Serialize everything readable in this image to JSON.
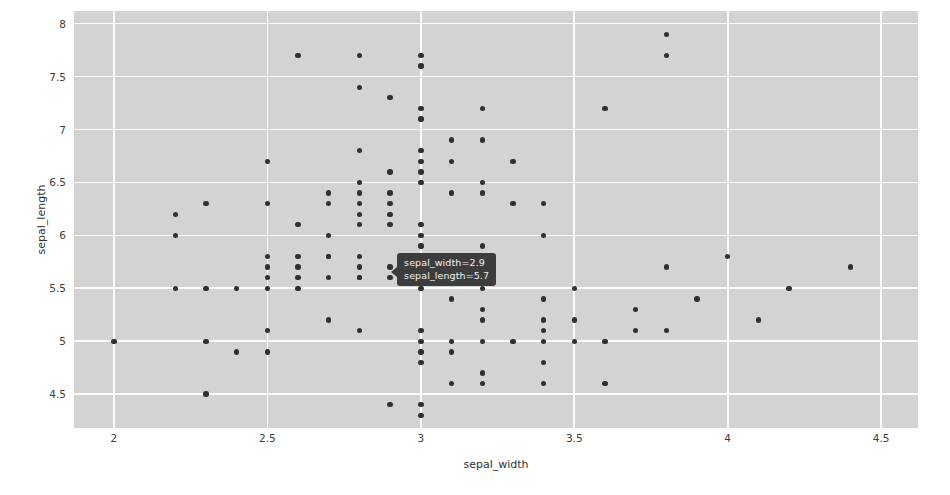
{
  "chart_data": {
    "type": "scatter",
    "title": "",
    "xlabel": "sepal_width",
    "ylabel": "sepal_length",
    "xlim": [
      1.87,
      4.62
    ],
    "ylim": [
      4.18,
      8.12
    ],
    "xticks": [
      "2",
      "2.5",
      "3",
      "3.5",
      "4",
      "4.5"
    ],
    "xtick_values": [
      2,
      2.5,
      3,
      3.5,
      4,
      4.5
    ],
    "yticks": [
      "4.5",
      "5",
      "5.5",
      "6",
      "6.5",
      "7",
      "7.5",
      "8"
    ],
    "ytick_values": [
      4.5,
      5,
      5.5,
      6,
      6.5,
      7,
      7.5,
      8
    ],
    "grid": true,
    "legend": false,
    "panel_background": "#d3d3d3",
    "grid_color": "#fdfdfd",
    "marker_color": "#303030",
    "points": [
      [
        2.0,
        5.0
      ],
      [
        2.2,
        6.2
      ],
      [
        2.2,
        6.0
      ],
      [
        2.2,
        5.5
      ],
      [
        2.3,
        6.3
      ],
      [
        2.3,
        5.5
      ],
      [
        2.3,
        5.0
      ],
      [
        2.3,
        4.5
      ],
      [
        2.4,
        5.5
      ],
      [
        2.4,
        4.9
      ],
      [
        2.5,
        6.7
      ],
      [
        2.5,
        6.3
      ],
      [
        2.5,
        5.8
      ],
      [
        2.5,
        5.7
      ],
      [
        2.5,
        5.6
      ],
      [
        2.5,
        5.5
      ],
      [
        2.5,
        5.1
      ],
      [
        2.5,
        4.9
      ],
      [
        2.6,
        7.7
      ],
      [
        2.6,
        6.1
      ],
      [
        2.6,
        5.8
      ],
      [
        2.6,
        5.7
      ],
      [
        2.6,
        5.6
      ],
      [
        2.6,
        5.5
      ],
      [
        2.7,
        6.4
      ],
      [
        2.7,
        6.3
      ],
      [
        2.7,
        6.0
      ],
      [
        2.7,
        5.8
      ],
      [
        2.7,
        5.6
      ],
      [
        2.7,
        5.2
      ],
      [
        2.7,
        5.8
      ],
      [
        2.8,
        7.7
      ],
      [
        2.8,
        7.4
      ],
      [
        2.8,
        6.8
      ],
      [
        2.8,
        6.5
      ],
      [
        2.8,
        6.4
      ],
      [
        2.8,
        6.3
      ],
      [
        2.8,
        6.2
      ],
      [
        2.8,
        6.1
      ],
      [
        2.8,
        5.8
      ],
      [
        2.8,
        5.7
      ],
      [
        2.8,
        5.6
      ],
      [
        2.8,
        5.6
      ],
      [
        2.8,
        5.1
      ],
      [
        2.9,
        7.3
      ],
      [
        2.9,
        6.6
      ],
      [
        2.9,
        6.4
      ],
      [
        2.9,
        6.3
      ],
      [
        2.9,
        6.2
      ],
      [
        2.9,
        6.1
      ],
      [
        2.9,
        5.7
      ],
      [
        2.9,
        5.6
      ],
      [
        2.9,
        4.4
      ],
      [
        3.0,
        7.7
      ],
      [
        3.0,
        7.6
      ],
      [
        3.0,
        7.2
      ],
      [
        3.0,
        7.1
      ],
      [
        3.0,
        6.8
      ],
      [
        3.0,
        6.7
      ],
      [
        3.0,
        6.6
      ],
      [
        3.0,
        6.5
      ],
      [
        3.0,
        6.1
      ],
      [
        3.0,
        6.0
      ],
      [
        3.0,
        5.9
      ],
      [
        3.0,
        5.8
      ],
      [
        3.0,
        5.7
      ],
      [
        3.0,
        5.6
      ],
      [
        3.0,
        5.5
      ],
      [
        3.0,
        5.1
      ],
      [
        3.0,
        5.0
      ],
      [
        3.0,
        4.9
      ],
      [
        3.0,
        4.8
      ],
      [
        3.0,
        4.4
      ],
      [
        3.0,
        4.3
      ],
      [
        3.1,
        6.9
      ],
      [
        3.1,
        6.7
      ],
      [
        3.1,
        6.4
      ],
      [
        3.1,
        5.4
      ],
      [
        3.1,
        5.0
      ],
      [
        3.1,
        4.9
      ],
      [
        3.1,
        4.6
      ],
      [
        3.2,
        7.2
      ],
      [
        3.2,
        6.9
      ],
      [
        3.2,
        6.5
      ],
      [
        3.2,
        6.4
      ],
      [
        3.2,
        5.9
      ],
      [
        3.2,
        5.5
      ],
      [
        3.2,
        5.3
      ],
      [
        3.2,
        5.2
      ],
      [
        3.2,
        5.0
      ],
      [
        3.2,
        4.7
      ],
      [
        3.2,
        4.6
      ],
      [
        3.3,
        6.7
      ],
      [
        3.3,
        6.3
      ],
      [
        3.3,
        5.0
      ],
      [
        3.4,
        6.3
      ],
      [
        3.4,
        6.0
      ],
      [
        3.4,
        5.4
      ],
      [
        3.4,
        5.2
      ],
      [
        3.4,
        5.1
      ],
      [
        3.4,
        5.0
      ],
      [
        3.4,
        4.8
      ],
      [
        3.4,
        4.6
      ],
      [
        3.5,
        5.5
      ],
      [
        3.5,
        5.2
      ],
      [
        3.5,
        5.0
      ],
      [
        3.6,
        7.2
      ],
      [
        3.6,
        5.0
      ],
      [
        3.6,
        4.6
      ],
      [
        3.7,
        5.3
      ],
      [
        3.7,
        5.1
      ],
      [
        3.8,
        7.9
      ],
      [
        3.8,
        7.7
      ],
      [
        3.8,
        5.7
      ],
      [
        3.8,
        5.1
      ],
      [
        3.9,
        5.4
      ],
      [
        4.0,
        5.8
      ],
      [
        4.1,
        5.2
      ],
      [
        4.2,
        5.5
      ],
      [
        4.4,
        5.7
      ]
    ]
  },
  "tooltip": {
    "visible": true,
    "row1": "sepal_width=2.9",
    "row2": "sepal_length=5.7",
    "anchor_x": 2.9,
    "anchor_y": 5.7,
    "background": "#3d3d3d",
    "text_color": "#f2f2f2"
  }
}
